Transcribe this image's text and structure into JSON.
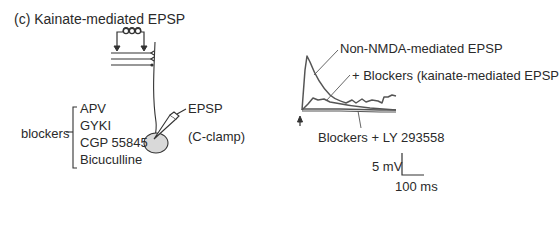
{
  "figure": {
    "title": "(c) Kainate-mediated EPSP",
    "schematic": {
      "recording_label": "EPSP",
      "clamp_label": "(C-clamp)",
      "blockers_label": "blockers",
      "blockers": [
        "APV",
        "GYKI",
        "CGP 55845",
        "Bicuculline"
      ]
    },
    "traces": {
      "labels": {
        "control": "Non-NMDA-mediated EPSP",
        "blockers": "+ Blockers (kainate-mediated EPSP",
        "ly": "Blockers + LY 293558"
      },
      "scale_bar": {
        "voltage": "5 mV",
        "time": "100 ms"
      }
    },
    "colors": {
      "line": "#333333",
      "trace": "#555555",
      "soma_fill": "#d9d9d9"
    }
  }
}
